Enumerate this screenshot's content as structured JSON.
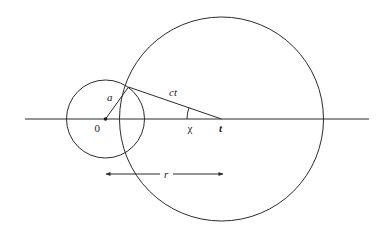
{
  "diagram": {
    "labels": {
      "origin": "0",
      "small_radius": "a",
      "large_radius": "ct",
      "angle": "χ",
      "point": "t",
      "distance": "r"
    },
    "elements": [
      "horizontal axis",
      "small circle centred at 0 with radius a",
      "large circle centred at t with radius ct",
      "radius segment a from 0 to intersection point",
      "segment ct from intersection point to t",
      "angle arc χ at t",
      "double-headed arrow r from 0 to t"
    ],
    "colors": {
      "line": "#2b2b2b",
      "background": "#ffffff"
    }
  }
}
